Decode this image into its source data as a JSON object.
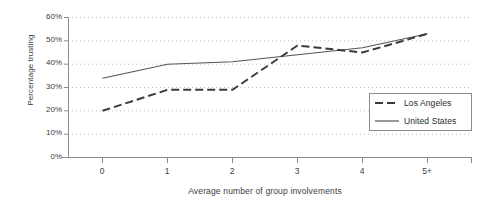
{
  "chart_data": {
    "type": "line",
    "title": "",
    "xlabel": "Average number of group involvements",
    "ylabel": "Percentage trusting",
    "categories": [
      "0",
      "1",
      "2",
      "3",
      "4",
      "5+"
    ],
    "ylim": [
      0,
      60
    ],
    "ytick_labels": [
      "0%",
      "10%",
      "20%",
      "30%",
      "40%",
      "50%",
      "60%"
    ],
    "ytick_values": [
      0,
      10,
      20,
      30,
      40,
      50,
      60
    ],
    "grid": "horizontal-dotted",
    "legend_position": "inside-right",
    "series": [
      {
        "name": "Los Angeles",
        "style": "dashed",
        "color": "#3a3a3a",
        "values": [
          20,
          29,
          29,
          48,
          45,
          53
        ]
      },
      {
        "name": "United States",
        "style": "solid",
        "color": "#555555",
        "values": [
          34,
          40,
          41,
          44,
          47,
          53
        ]
      }
    ]
  },
  "legend": {
    "items": [
      {
        "label": "Los Angeles",
        "swatch": "dashed-line-swatch"
      },
      {
        "label": "United States",
        "swatch": "solid-line-swatch"
      }
    ]
  },
  "colors": {
    "axis": "#8c8c8c",
    "grid": "#bfbfbf",
    "text": "#3c3c3c",
    "series_dashed": "#3a3a3a",
    "series_solid": "#555555"
  }
}
